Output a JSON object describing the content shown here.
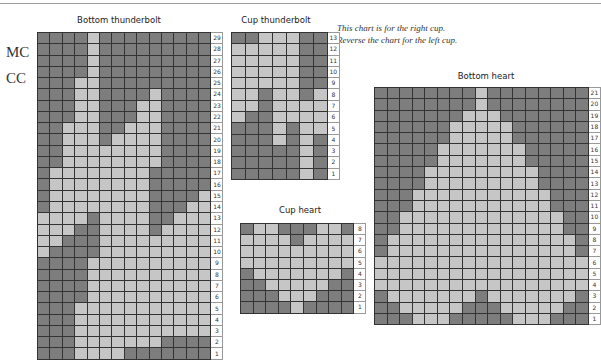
{
  "legend": {
    "mc_label": "MC",
    "cc_label": "CC"
  },
  "note": {
    "line1": "This chart is for the right cup.",
    "line2": "Reverse the chart for the left cup."
  },
  "colors": {
    "MC": "#7d7d7d",
    "CC": "#c6c6c6",
    "grid_line": "#333333"
  },
  "chart_data": [
    {
      "type": "table",
      "title": "Bottom thunderbolt",
      "columns": 14,
      "row_labels_top_to_bottom": [
        29,
        28,
        27,
        26,
        25,
        24,
        23,
        22,
        21,
        20,
        19,
        18,
        17,
        16,
        15,
        14,
        13,
        12,
        11,
        10,
        9,
        8,
        7,
        6,
        5,
        4,
        3,
        2,
        1
      ],
      "key": {
        "D": "MC",
        "L": "CC"
      },
      "rows": [
        "DDDDLDDDDDDDDD",
        "DDDDLDDDDDDDDD",
        "DDDDLDDDDDDDDD",
        "DDDDLDDDDDDDDD",
        "DDDLLDDDDDDDDD",
        "DDDLLDDDDLDDDD",
        "DDDLLDDDLLDDDD",
        "DDDLLDDDLLDDDD",
        "DDLLLDDLLLDDDD",
        "DDLLLDLLLLDDDD",
        "DDLLLLLLLLDDDD",
        "DDLLLLLLLLDDDD",
        "DLLLLLLLLDDDDD",
        "DLLLLLLLLDDDDD",
        "DLLLLLLLLDDDDL",
        "DLLLLLLLLDDDLL",
        "LLLLDLLLLDDLLL",
        "LLLDDLLLLDLLLL",
        "LLDDDLLLLLLLLL",
        "LDDDDLLLLLLLLL",
        "DDDDLLLLLLLLLL",
        "DDDDLLLLLLLLLL",
        "DDDDLLLLLLLLLL",
        "DDDDLLLLLLLLLL",
        "DDDLLLLLLLLLLL",
        "DDDLLLLLLLLLLL",
        "DDDLLLLLLLLLLL",
        "DDDLLLLLLLDDDD",
        "DDDLLLLDDDDDDD"
      ]
    },
    {
      "type": "table",
      "title": "Cup thunderbolt",
      "columns": 7,
      "row_labels_top_to_bottom": [
        13,
        12,
        11,
        10,
        9,
        8,
        7,
        6,
        5,
        4,
        3,
        2,
        1
      ],
      "key": {
        "D": "MC",
        "L": "CC"
      },
      "rows": [
        "DDLLLDD",
        "LLLLLDD",
        "LLLLLDD",
        "LLLLLDD",
        "LLLLLDD",
        "LLDLLDL",
        "LLDLLLL",
        "LDDLLLL",
        "DDDLDLL",
        "DDDLDLD",
        "DDDDDLD",
        "DDDDDLD",
        "DDDDDLD"
      ]
    },
    {
      "type": "table",
      "title": "Cup heart",
      "columns": 9,
      "row_labels_top_to_bottom": [
        8,
        7,
        6,
        5,
        4,
        3,
        2,
        1
      ],
      "key": {
        "D": "MC",
        "L": "CC"
      },
      "rows": [
        "DLLDDDLLD",
        "LLLLDLLLL",
        "LLLLLLLLL",
        "LLLLLLLLL",
        "DLLLLLLLD",
        "DDLLLLLDD",
        "DDDLLLDDD",
        "DDDDLDDDD"
      ]
    },
    {
      "type": "table",
      "title": "Bottom heart",
      "columns": 17,
      "row_labels_top_to_bottom": [
        21,
        20,
        19,
        18,
        17,
        16,
        15,
        14,
        13,
        12,
        11,
        10,
        9,
        8,
        7,
        6,
        5,
        4,
        3,
        2,
        1
      ],
      "key": {
        "D": "MC",
        "L": "CC"
      },
      "rows": [
        "DDDDDDDDLDDDDDDDD",
        "DDDDDDDDLDDDDDDDD",
        "DDDDDDDLLLDDDDDDD",
        "DDDDDDLLLLLDDDDDD",
        "DDDDDDLLLLLDDDDDD",
        "DDDDDLLLLLLLDDDDD",
        "DDDDDLLLLLLLDDDDD",
        "DDDDLLLLLLLLLDDDD",
        "DDDDLLLLLLLLLDDDD",
        "DDDLLLLLLLLLLLDDD",
        "DDDLLLLLLLLLLLDDD",
        "DDLLLLLLLLLLLLLDD",
        "DDLLLLLLLLLLLLLDD",
        "DLLLLLLLLLLLLLLLD",
        "DLLLLLLLLLLLLLLLD",
        "LLLLLLLLLLLLLLLLL",
        "LLLLLLLLLLLLLLLLL",
        "LLLLLLLLLLLLLLLLL",
        "DLLLLLLLDLLLLLLLD",
        "DDLLLLLDDDLLLLLDD",
        "DDDLLLDDDDDLLLDDD"
      ]
    }
  ]
}
